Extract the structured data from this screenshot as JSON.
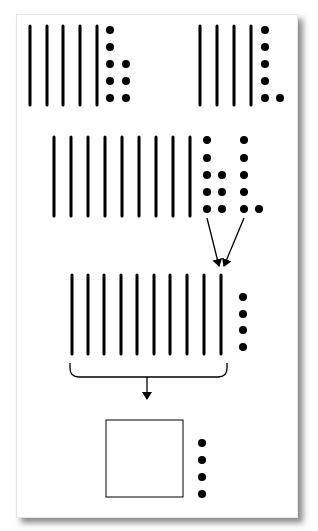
{
  "colors": {
    "ink": "#000000",
    "background": "#ffffff",
    "card_border": "#e6e6e6"
  },
  "stick": {
    "height": 79,
    "width": 3
  },
  "dot": {
    "radius": 4
  },
  "groups": [
    {
      "name": "number-group-top-left",
      "description": "5 tens and 8 ones",
      "sticks_x": [
        30,
        47,
        63,
        80,
        97
      ],
      "stick_top": 26,
      "dot_columns": [
        {
          "x": 110,
          "y": [
            30,
            47,
            64,
            81,
            98
          ]
        },
        {
          "x": 126,
          "y": [
            64,
            81,
            98
          ]
        }
      ]
    },
    {
      "name": "number-group-top-right",
      "description": "4 tens and 6 ones",
      "sticks_x": [
        200,
        217,
        234,
        251
      ],
      "stick_top": 26,
      "dot_columns": [
        {
          "x": 265,
          "y": [
            30,
            47,
            64,
            81,
            98
          ]
        },
        {
          "x": 280,
          "y": [
            98
          ]
        }
      ]
    },
    {
      "name": "number-group-combined",
      "description": "9 tens and 14 ones",
      "sticks_x": [
        54,
        71,
        88,
        105,
        122,
        139,
        156,
        173,
        190
      ],
      "stick_top": 137,
      "dot_columns": [
        {
          "x": 207,
          "y": [
            140,
            158,
            175,
            192,
            209
          ]
        },
        {
          "x": 222,
          "y": [
            175,
            192,
            209
          ]
        },
        {
          "x": 244,
          "y": [
            140,
            158,
            175,
            192,
            209
          ]
        },
        {
          "x": 259,
          "y": [
            209
          ]
        }
      ]
    },
    {
      "name": "number-group-regrouped",
      "description": "10 tens and 4 ones",
      "sticks_x": [
        72,
        88,
        104,
        121,
        137,
        154,
        170,
        187,
        204,
        221
      ],
      "stick_top": 275,
      "dot_columns": [
        {
          "x": 243,
          "y": [
            297,
            314,
            330,
            347
          ]
        }
      ]
    },
    {
      "name": "number-group-hundred",
      "description": "1 hundred and 4 ones",
      "sticks_x": [],
      "stick_top": 0,
      "dot_columns": [
        {
          "x": 202,
          "y": [
            443,
            460,
            477,
            494
          ]
        }
      ]
    }
  ],
  "arrows": [
    {
      "name": "arrow-left-to-ten",
      "x1": 207,
      "y1": 218,
      "x2": 219,
      "y2": 266
    },
    {
      "name": "arrow-right-to-ten",
      "x1": 244,
      "y1": 218,
      "x2": 224,
      "y2": 266
    },
    {
      "name": "arrow-brace-to-hundred",
      "x1": 147,
      "y1": 377,
      "x2": 147,
      "y2": 399
    }
  ],
  "brace": {
    "x1": 70,
    "x2": 227,
    "top": 363,
    "bottom": 377,
    "radius": 9
  },
  "hundred_square": {
    "x": 106,
    "y": 420,
    "size": 77
  }
}
